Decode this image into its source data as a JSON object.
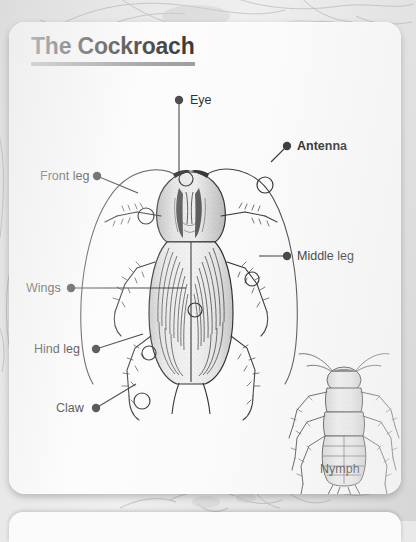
{
  "page": {
    "card_title": "The Cockroach",
    "background_description": "gray book page"
  },
  "diagram": {
    "main_figure_caption": "",
    "secondary_figure_caption": "Nymph",
    "labels": [
      {
        "id": "eye",
        "text": "Eye",
        "bold": false,
        "dot_x": 179,
        "dot_y": 100,
        "text_x": 190,
        "text_y": 93,
        "anchor_x": 177,
        "anchor_y": 157,
        "leader": "vertical"
      },
      {
        "id": "antenna",
        "text": "Antenna",
        "bold": true,
        "dot_x": 287,
        "dot_y": 146,
        "text_x": 297,
        "text_y": 139,
        "anchor_x": 256,
        "anchor_y": 163,
        "leader": "straight"
      },
      {
        "id": "front-leg",
        "text": "Front leg",
        "bold": false,
        "dot_x": 97,
        "dot_y": 176,
        "text_x": 40,
        "text_y": 169,
        "anchor_x": 137,
        "anchor_y": 194,
        "leader": "straight"
      },
      {
        "id": "middle-leg",
        "text": "Middle leg",
        "bold": false,
        "dot_x": 287,
        "dot_y": 256,
        "text_x": 297,
        "text_y": 249,
        "anchor_x": 243,
        "anchor_y": 257,
        "leader": "straight"
      },
      {
        "id": "wings",
        "text": "Wings",
        "bold": false,
        "dot_x": 71,
        "dot_y": 288,
        "text_x": 26,
        "text_y": 281,
        "anchor_x": 186,
        "anchor_y": 288,
        "leader": "straight"
      },
      {
        "id": "hind-leg",
        "text": "Hind leg",
        "bold": false,
        "dot_x": 96,
        "dot_y": 349,
        "text_x": 34,
        "text_y": 342,
        "anchor_x": 140,
        "anchor_y": 331,
        "leader": "straight"
      },
      {
        "id": "claw",
        "text": "Claw",
        "bold": false,
        "dot_x": 96,
        "dot_y": 408,
        "text_x": 56,
        "text_y": 401,
        "anchor_x": 133,
        "anchor_y": 379,
        "leader": "straight"
      }
    ],
    "colors": {
      "ink": "#1a1a1a",
      "leader_line": "#2a2a2a",
      "title_rule": "#8d8d8d",
      "card": "#fbfbfb",
      "page": "#e4e4e4"
    }
  }
}
